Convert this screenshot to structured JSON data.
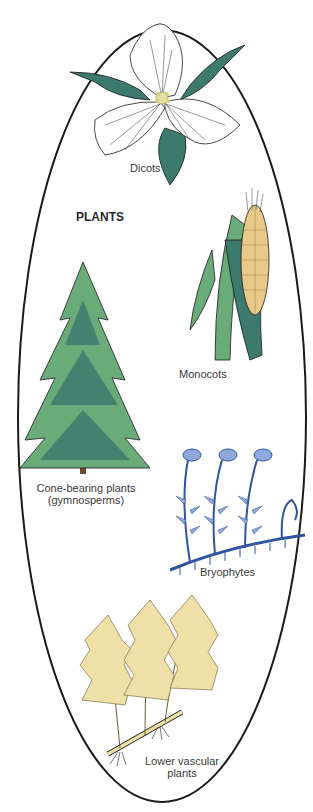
{
  "diagram": {
    "title": "PLANTS",
    "container_shape": "ellipse",
    "groups": [
      {
        "id": "dicots",
        "label": "Dicots",
        "icon": "trillium-flower-icon"
      },
      {
        "id": "monocots",
        "label": "Monocots",
        "icon": "corn-ear-icon"
      },
      {
        "id": "gymnosperms",
        "label_line1": "Cone-bearing plants",
        "label_line2": "(gymnosperms)",
        "icon": "conifer-tree-icon"
      },
      {
        "id": "bryophytes",
        "label": "Bryophytes",
        "icon": "moss-icon"
      },
      {
        "id": "lower-vascular",
        "label_line1": "Lower vascular",
        "label_line2": "plants",
        "icon": "fern-icon"
      }
    ],
    "colors": {
      "outline": "#1a1a1a",
      "leaf_dark": "#3d7a6e",
      "leaf_light": "#6aab7a",
      "corn_kernel": "#e8c98a",
      "moss_light": "#8fa8dc",
      "moss_dark": "#2f54a0",
      "fern": "#efe0a8"
    }
  }
}
